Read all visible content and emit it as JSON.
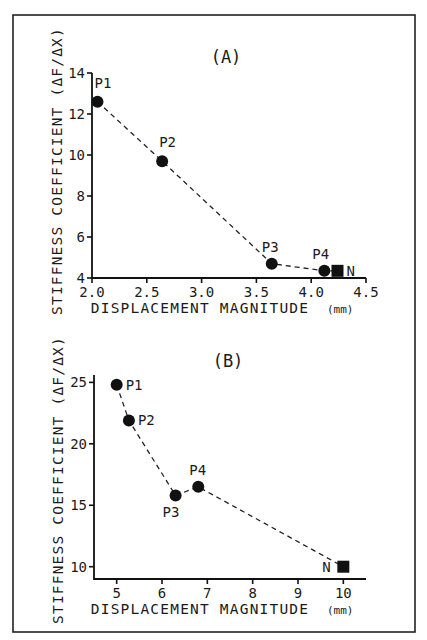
{
  "chart_data": [
    {
      "type": "line",
      "title": "(A)",
      "xlabel": "DISPLACEMENT MAGNITUDE",
      "xunit": "(mm)",
      "ylabel": "STIFFNESS COEFFICIENT (ΔF/ΔX)",
      "xlim": [
        2.0,
        4.5
      ],
      "ylim": [
        4,
        14
      ],
      "xticks": [
        2.0,
        2.5,
        3.0,
        3.5,
        4.0,
        4.5
      ],
      "xtick_labels": [
        "2.0",
        "2.5",
        "3.0",
        "3.5",
        "4.0",
        "4.5"
      ],
      "yticks": [
        4,
        6,
        8,
        10,
        12,
        14
      ],
      "ytick_labels": [
        "4",
        "6",
        "8",
        "10",
        "12",
        "14"
      ],
      "grid": false,
      "line_style": "dashed",
      "points": [
        {
          "label": "P1",
          "x": 2.05,
          "y": 12.6,
          "marker": "circle"
        },
        {
          "label": "P2",
          "x": 2.64,
          "y": 9.7,
          "marker": "circle"
        },
        {
          "label": "P3",
          "x": 3.64,
          "y": 4.7,
          "marker": "circle"
        },
        {
          "label": "P4",
          "x": 4.12,
          "y": 4.35,
          "marker": "circle"
        },
        {
          "label": "N",
          "x": 4.24,
          "y": 4.35,
          "marker": "square"
        }
      ]
    },
    {
      "type": "line",
      "title": "(B)",
      "xlabel": "DISPLACEMENT MAGNITUDE",
      "xunit": "(mm)",
      "ylabel": "STIFFNESS COEFFICIENT (ΔF/ΔX)",
      "xlim": [
        4.5,
        10.5
      ],
      "ylim": [
        9,
        25.6
      ],
      "xticks": [
        5,
        6,
        7,
        8,
        9,
        10
      ],
      "xtick_labels": [
        "5",
        "6",
        "7",
        "8",
        "9",
        "10"
      ],
      "yticks": [
        10,
        15,
        20,
        25
      ],
      "ytick_labels": [
        "10",
        "15",
        "20",
        "25"
      ],
      "grid": false,
      "line_style": "dashed",
      "points": [
        {
          "label": "P1",
          "x": 5.0,
          "y": 24.8,
          "marker": "circle"
        },
        {
          "label": "P2",
          "x": 5.27,
          "y": 21.9,
          "marker": "circle"
        },
        {
          "label": "P3",
          "x": 6.3,
          "y": 15.8,
          "marker": "circle"
        },
        {
          "label": "P4",
          "x": 6.8,
          "y": 16.5,
          "marker": "circle"
        },
        {
          "label": "N",
          "x": 10.0,
          "y": 10.0,
          "marker": "square"
        }
      ]
    }
  ]
}
